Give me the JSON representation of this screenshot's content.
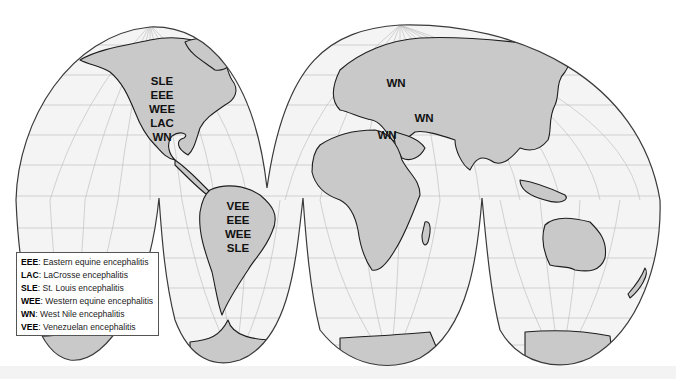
{
  "map": {
    "projection": "interrupted homolosine",
    "colors": {
      "ocean": "#f4f4f4",
      "land": "#c9c9c9",
      "coastline": "#1e1e1e",
      "graticule": "#b9b9b9",
      "outline": "#3a3a3a"
    },
    "regions": [
      {
        "name": "North America",
        "codes": [
          "SLE",
          "EEE",
          "WEE",
          "LAC",
          "WN"
        ]
      },
      {
        "name": "South America",
        "codes": [
          "VEE",
          "EEE",
          "WEE",
          "SLE"
        ]
      },
      {
        "name": "Europe",
        "codes": [
          "WN"
        ]
      },
      {
        "name": "Middle East",
        "codes": [
          "WN"
        ]
      },
      {
        "name": "North Africa",
        "codes": [
          "WN"
        ]
      }
    ]
  },
  "legend": {
    "items": [
      {
        "code": "EEE",
        "label": ": Eastern equine encephalitis"
      },
      {
        "code": "LAC",
        "label": ": LaCrosse encephalitis"
      },
      {
        "code": "SLE",
        "label": ": St. Louis encephalitis"
      },
      {
        "code": "WEE",
        "label": ": Western equine encephalitis"
      },
      {
        "code": "WN",
        "label": ": West Nile encephalitis"
      },
      {
        "code": "VEE",
        "label": ": Venezuelan encephalitis"
      }
    ]
  }
}
